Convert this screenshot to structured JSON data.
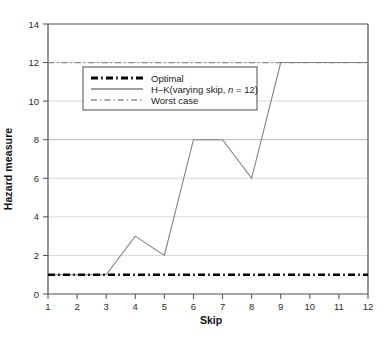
{
  "chart_data": {
    "type": "line",
    "title": "",
    "xlabel": "Skip",
    "ylabel": "Hazard measure",
    "x": [
      1,
      2,
      3,
      4,
      5,
      6,
      7,
      8,
      9,
      10,
      11,
      12
    ],
    "xlim": [
      1,
      12
    ],
    "ylim": [
      0,
      14
    ],
    "xticks": [
      "1",
      "2",
      "3",
      "4",
      "5",
      "6",
      "7",
      "8",
      "9",
      "10",
      "11",
      "12"
    ],
    "yticks": [
      "0",
      "2",
      "4",
      "6",
      "8",
      "10",
      "12",
      "14"
    ],
    "grid": "horizontal",
    "legend_position": "upper-left-inside",
    "series": [
      {
        "name": "Optimal",
        "style": "dash-dot",
        "color": "#000000",
        "width": 2.6,
        "constant_value": 1,
        "values": [
          1,
          1,
          1,
          1,
          1,
          1,
          1,
          1,
          1,
          1,
          1,
          1
        ]
      },
      {
        "name": "H–K(varying skip, n = 12)",
        "name_prefix": "H–K(varying skip, ",
        "name_italic": "n",
        "name_suffix": " = 12)",
        "style": "solid",
        "color": "#808080",
        "width": 1.1,
        "values": [
          1,
          1,
          1,
          3,
          2,
          8,
          8,
          6,
          12,
          12,
          12,
          12
        ]
      },
      {
        "name": "Worst case",
        "style": "dash-dot",
        "color": "#8c8c8c",
        "width": 1.3,
        "constant_value": 12,
        "values": [
          12,
          12,
          12,
          12,
          12,
          12,
          12,
          12,
          12,
          12,
          12,
          12
        ]
      }
    ]
  },
  "axes": {
    "x_title": "Skip",
    "y_title": "Hazard measure"
  },
  "legend": {
    "entries": [
      {
        "label": "Optimal"
      },
      {
        "label": "H–K(varying skip, n = 12)"
      },
      {
        "label": "Worst case"
      }
    ]
  },
  "colors": {
    "frame": "#4d4d4d",
    "grid": "#d8d8d8",
    "optimal": "#000000",
    "hk": "#808080",
    "worst": "#8c8c8c",
    "background": "#ffffff"
  }
}
